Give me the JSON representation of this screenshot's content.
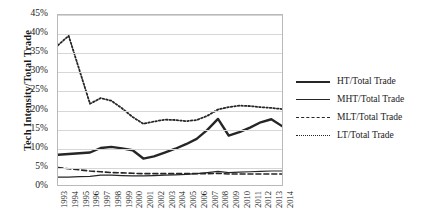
{
  "chart_data": {
    "type": "line",
    "title": "",
    "xlabel": "",
    "ylabel": "Tech Intensity/Total Trade",
    "ylim": [
      0,
      45
    ],
    "ytick_labels": [
      "45%",
      "40%",
      "35%",
      "30%",
      "25%",
      "20%",
      "15%",
      "10%",
      "5%",
      "0%"
    ],
    "ytick_values": [
      45,
      40,
      35,
      30,
      25,
      20,
      15,
      10,
      5,
      0
    ],
    "grid": true,
    "legend_position": "right",
    "x": [
      "1993",
      "1994",
      "1995",
      "1996",
      "1997",
      "1998",
      "1999",
      "2000",
      "2001",
      "2002",
      "2003",
      "2004",
      "2005",
      "2006",
      "2007",
      "2008",
      "2009",
      "2010",
      "2011",
      "2012",
      "2013",
      "2014"
    ],
    "series": [
      {
        "name": "HT/Total Trade",
        "style": "solid-thick",
        "color": "#262626",
        "values": [
          8.0,
          8.2,
          8.4,
          8.6,
          9.8,
          10.1,
          9.7,
          9.2,
          7.0,
          7.6,
          8.6,
          9.6,
          10.8,
          12.2,
          14.6,
          17.5,
          13.1,
          14.0,
          15.2,
          16.6,
          17.4,
          15.6
        ]
      },
      {
        "name": "MHT/Total Trade",
        "style": "solid-thin",
        "color": "#262626",
        "values": [
          2.1,
          2.1,
          2.2,
          2.3,
          2.6,
          2.6,
          2.5,
          2.4,
          2.4,
          2.5,
          2.6,
          2.7,
          2.8,
          3.0,
          3.3,
          3.6,
          3.3,
          3.4,
          3.5,
          3.6,
          3.7,
          3.7
        ]
      },
      {
        "name": "MLT/Total Trade",
        "style": "dashed",
        "color": "#262626",
        "values": [
          4.6,
          4.3,
          4.0,
          3.7,
          3.5,
          3.3,
          3.2,
          3.1,
          3.0,
          3.0,
          3.0,
          3.0,
          3.0,
          3.0,
          3.0,
          3.1,
          2.9,
          2.9,
          2.9,
          2.9,
          2.9,
          2.9
        ]
      },
      {
        "name": "LT/Total Trade",
        "style": "dotted",
        "color": "#262626",
        "values": [
          37.0,
          39.5,
          30.5,
          21.5,
          23.0,
          22.3,
          20.3,
          18.0,
          16.2,
          16.8,
          17.3,
          17.2,
          16.9,
          17.2,
          18.3,
          20.0,
          20.6,
          21.0,
          20.9,
          20.6,
          20.4,
          20.1
        ]
      }
    ]
  },
  "legend": {
    "items": [
      {
        "label": "HT/Total Trade"
      },
      {
        "label": "MHT/Total Trade"
      },
      {
        "label": "MLT/Total Trade"
      },
      {
        "label": "LT/Total Trade"
      }
    ]
  }
}
